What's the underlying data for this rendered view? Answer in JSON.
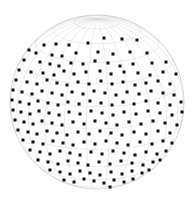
{
  "figure": {
    "title": "",
    "background_color": "#ffffff",
    "width": 194,
    "height": 204
  },
  "chart_data": {
    "type": "scatter",
    "projection": "orthographic-sphere",
    "title": "",
    "subtitle": "",
    "xlabel": "",
    "ylabel": "",
    "grid": true,
    "legend": null,
    "annotations": [],
    "sphere": {
      "center_x": 97,
      "center_y": 102,
      "radius": 87,
      "outline_color": "#c9c9c9",
      "outline_width": 0.7
    },
    "graticule": {
      "meridian_step_deg": 15,
      "parallel_step_deg": 15,
      "line_color": "#d6d6d6",
      "line_width": 0.5,
      "view_rotation_deg": 8,
      "view_tilt_deg": 18
    },
    "points": {
      "marker": "square",
      "marker_size_px": 3,
      "color": "#111111",
      "count": 206,
      "coordinates_px": [
        [
          149,
          30
        ],
        [
          160,
          32
        ],
        [
          104,
          38
        ],
        [
          122,
          39
        ],
        [
          137,
          40
        ],
        [
          44,
          45
        ],
        [
          56,
          44
        ],
        [
          69,
          45
        ],
        [
          88,
          43
        ],
        [
          168,
          45
        ],
        [
          29,
          50
        ],
        [
          36,
          53
        ],
        [
          52,
          55
        ],
        [
          62,
          56
        ],
        [
          76,
          53
        ],
        [
          98,
          52
        ],
        [
          113,
          54
        ],
        [
          130,
          52
        ],
        [
          147,
          53
        ],
        [
          175,
          52
        ],
        [
          24,
          60
        ],
        [
          40,
          62
        ],
        [
          50,
          64
        ],
        [
          59,
          66
        ],
        [
          71,
          63
        ],
        [
          83,
          64
        ],
        [
          95,
          61
        ],
        [
          108,
          63
        ],
        [
          120,
          66
        ],
        [
          133,
          64
        ],
        [
          152,
          63
        ],
        [
          166,
          62
        ],
        [
          179,
          64
        ],
        [
          19,
          70
        ],
        [
          31,
          72
        ],
        [
          43,
          73
        ],
        [
          54,
          75
        ],
        [
          64,
          71
        ],
        [
          74,
          74
        ],
        [
          86,
          72
        ],
        [
          100,
          71
        ],
        [
          111,
          74
        ],
        [
          124,
          72
        ],
        [
          138,
          73
        ],
        [
          150,
          75
        ],
        [
          163,
          72
        ],
        [
          176,
          74
        ],
        [
          183,
          71
        ],
        [
          16,
          80
        ],
        [
          27,
          82
        ],
        [
          37,
          84
        ],
        [
          47,
          80
        ],
        [
          57,
          83
        ],
        [
          67,
          85
        ],
        [
          78,
          82
        ],
        [
          89,
          84
        ],
        [
          101,
          81
        ],
        [
          112,
          84
        ],
        [
          123,
          82
        ],
        [
          135,
          85
        ],
        [
          146,
          83
        ],
        [
          158,
          81
        ],
        [
          170,
          84
        ],
        [
          181,
          82
        ],
        [
          13,
          90
        ],
        [
          22,
          92
        ],
        [
          32,
          94
        ],
        [
          42,
          91
        ],
        [
          52,
          93
        ],
        [
          62,
          95
        ],
        [
          72,
          92
        ],
        [
          83,
          94
        ],
        [
          94,
          91
        ],
        [
          105,
          93
        ],
        [
          116,
          95
        ],
        [
          127,
          92
        ],
        [
          139,
          94
        ],
        [
          151,
          91
        ],
        [
          163,
          93
        ],
        [
          174,
          95
        ],
        [
          184,
          92
        ],
        [
          12,
          100
        ],
        [
          20,
          102
        ],
        [
          29,
          104
        ],
        [
          38,
          101
        ],
        [
          48,
          103
        ],
        [
          58,
          105
        ],
        [
          68,
          102
        ],
        [
          79,
          104
        ],
        [
          90,
          101
        ],
        [
          101,
          103
        ],
        [
          112,
          105
        ],
        [
          123,
          102
        ],
        [
          134,
          104
        ],
        [
          146,
          101
        ],
        [
          158,
          103
        ],
        [
          170,
          105
        ],
        [
          181,
          102
        ],
        [
          186,
          100
        ],
        [
          13,
          110
        ],
        [
          21,
          112
        ],
        [
          30,
          114
        ],
        [
          39,
          111
        ],
        [
          49,
          113
        ],
        [
          59,
          115
        ],
        [
          69,
          112
        ],
        [
          80,
          114
        ],
        [
          91,
          111
        ],
        [
          102,
          113
        ],
        [
          113,
          115
        ],
        [
          124,
          112
        ],
        [
          136,
          114
        ],
        [
          148,
          111
        ],
        [
          160,
          113
        ],
        [
          172,
          115
        ],
        [
          182,
          112
        ],
        [
          15,
          120
        ],
        [
          24,
          122
        ],
        [
          33,
          124
        ],
        [
          42,
          121
        ],
        [
          52,
          123
        ],
        [
          62,
          125
        ],
        [
          73,
          122
        ],
        [
          84,
          124
        ],
        [
          95,
          121
        ],
        [
          106,
          123
        ],
        [
          117,
          125
        ],
        [
          129,
          122
        ],
        [
          141,
          124
        ],
        [
          153,
          121
        ],
        [
          165,
          123
        ],
        [
          177,
          125
        ],
        [
          18,
          130
        ],
        [
          28,
          132
        ],
        [
          37,
          134
        ],
        [
          47,
          131
        ],
        [
          57,
          133
        ],
        [
          67,
          135
        ],
        [
          78,
          132
        ],
        [
          89,
          134
        ],
        [
          100,
          131
        ],
        [
          111,
          133
        ],
        [
          122,
          135
        ],
        [
          134,
          132
        ],
        [
          146,
          134
        ],
        [
          158,
          131
        ],
        [
          170,
          133
        ],
        [
          178,
          135
        ],
        [
          23,
          140
        ],
        [
          33,
          142
        ],
        [
          43,
          144
        ],
        [
          53,
          141
        ],
        [
          63,
          143
        ],
        [
          73,
          145
        ],
        [
          84,
          142
        ],
        [
          95,
          144
        ],
        [
          106,
          141
        ],
        [
          117,
          143
        ],
        [
          128,
          145
        ],
        [
          140,
          142
        ],
        [
          152,
          144
        ],
        [
          163,
          141
        ],
        [
          172,
          143
        ],
        [
          30,
          150
        ],
        [
          40,
          152
        ],
        [
          50,
          154
        ],
        [
          60,
          151
        ],
        [
          70,
          153
        ],
        [
          80,
          155
        ],
        [
          91,
          152
        ],
        [
          102,
          154
        ],
        [
          113,
          151
        ],
        [
          124,
          153
        ],
        [
          135,
          155
        ],
        [
          146,
          152
        ],
        [
          157,
          154
        ],
        [
          166,
          151
        ],
        [
          38,
          160
        ],
        [
          48,
          162
        ],
        [
          58,
          164
        ],
        [
          68,
          161
        ],
        [
          78,
          163
        ],
        [
          88,
          165
        ],
        [
          99,
          162
        ],
        [
          110,
          164
        ],
        [
          121,
          161
        ],
        [
          132,
          163
        ],
        [
          143,
          165
        ],
        [
          153,
          162
        ],
        [
          160,
          160
        ],
        [
          50,
          170
        ],
        [
          60,
          172
        ],
        [
          70,
          174
        ],
        [
          80,
          171
        ],
        [
          90,
          173
        ],
        [
          100,
          175
        ],
        [
          111,
          172
        ],
        [
          122,
          174
        ],
        [
          132,
          171
        ],
        [
          142,
          173
        ],
        [
          149,
          170
        ],
        [
          64,
          180
        ],
        [
          74,
          182
        ],
        [
          84,
          179
        ],
        [
          94,
          181
        ],
        [
          104,
          183
        ],
        [
          114,
          180
        ],
        [
          124,
          182
        ],
        [
          133,
          179
        ],
        [
          80,
          188
        ],
        [
          90,
          189
        ],
        [
          100,
          188
        ],
        [
          110,
          187
        ]
      ]
    }
  }
}
